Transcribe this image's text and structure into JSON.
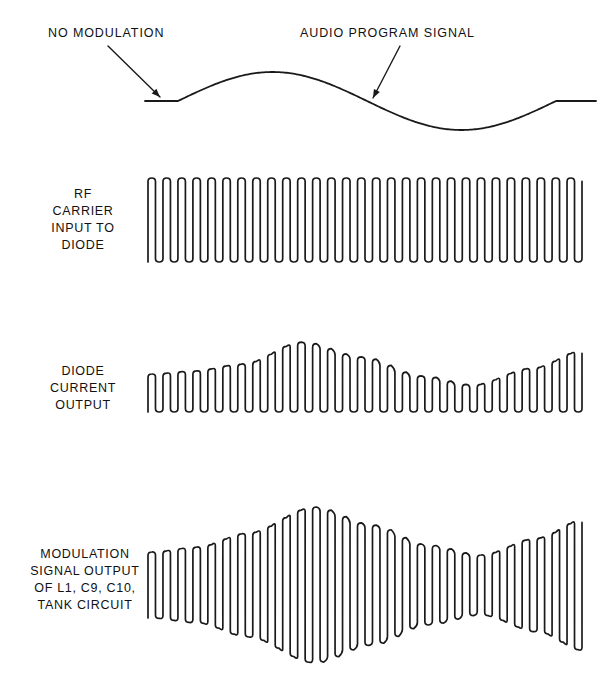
{
  "figure": {
    "background_color": "#ffffff",
    "line_color": "#1a1a1a"
  },
  "callouts": [
    {
      "id": "no-modulation",
      "text": "NO MODULATION",
      "leader": {
        "x1": 108,
        "y1": 46,
        "x2": 160,
        "y2": 97
      }
    },
    {
      "id": "audio-program-signal",
      "text": "AUDIO PROGRAM SIGNAL",
      "leader": {
        "x1": 400,
        "y1": 46,
        "x2": 373,
        "y2": 98
      }
    }
  ],
  "trace_labels": [
    {
      "id": "rf-carrier-input-to-diode",
      "lines": [
        "RF",
        "CARRIER",
        "INPUT TO",
        "DIODE"
      ]
    },
    {
      "id": "diode-current-output",
      "lines": [
        "DIODE",
        "CURRENT",
        "OUTPUT"
      ]
    },
    {
      "id": "modulation-signal-output",
      "lines": [
        "MODULATION",
        "SIGNAL OUTPUT",
        "OF L1, C9, C10,",
        "TANK CIRCUIT"
      ]
    }
  ],
  "chart_data": [
    {
      "id": "audio-program-waveform",
      "type": "line",
      "title": "Audio program signal (modulating envelope)",
      "description": "Flat no-modulation segment followed by one cycle of an audio sine wave, ending in a flat segment.",
      "xlabel": "",
      "ylabel": "",
      "x_range": [
        145,
        596
      ],
      "y_baseline": 101,
      "flat_lead_in": {
        "x_start": 145,
        "x_end": 178,
        "y": 101
      },
      "flat_lead_out": {
        "x_start": 556,
        "x_end": 596,
        "y": 101
      },
      "sine": {
        "x_start": 178,
        "x_end": 556,
        "cycles": 1,
        "amplitude": 29,
        "peak_x": 272,
        "peak_y": 72,
        "zero_cross_x": 367,
        "trough_x": 462,
        "trough_y": 130
      }
    },
    {
      "id": "rf-carrier-input-waveform",
      "type": "line",
      "title": "RF carrier input to diode",
      "description": "Unmodulated RF carrier drawn as a dense constant-amplitude oscilloscope trace with rounded peaks.",
      "xlabel": "",
      "ylabel": "",
      "x_range": [
        148,
        582
      ],
      "cycles": 29,
      "center_y": 220,
      "amplitude_constant": 42,
      "top_y": 178,
      "bottom_y": 263,
      "envelope": "constant"
    },
    {
      "id": "diode-current-output-waveform",
      "type": "line",
      "title": "Diode current output",
      "description": "Half-wave rectified carrier: bottoms rest on a flat baseline while the tops follow the audio envelope.",
      "xlabel": "",
      "ylabel": "",
      "x_range": [
        148,
        582
      ],
      "cycles": 29,
      "baseline_y": 412,
      "envelope": "rectified-one-sided",
      "amplitude_min": 27,
      "amplitude_max": 70,
      "envelope_peak_x": 300,
      "envelope_trough_x": 470,
      "envelope_samples": [
        {
          "x": 148,
          "amplitude": 38
        },
        {
          "x": 190,
          "amplitude": 41
        },
        {
          "x": 240,
          "amplitude": 48
        },
        {
          "x": 300,
          "amplitude": 70
        },
        {
          "x": 360,
          "amplitude": 55
        },
        {
          "x": 420,
          "amplitude": 36
        },
        {
          "x": 470,
          "amplitude": 27
        },
        {
          "x": 530,
          "amplitude": 44
        },
        {
          "x": 582,
          "amplitude": 62
        }
      ]
    },
    {
      "id": "modulation-signal-output-waveform",
      "type": "line",
      "title": "Modulation signal output of L1, C9, C10 tank circuit",
      "description": "Amplitude-modulated carrier symmetric about a center axis; envelope swells to a maximum then narrows and grows again.",
      "xlabel": "",
      "ylabel": "",
      "x_range": [
        148,
        582
      ],
      "cycles": 29,
      "center_y": 585,
      "envelope": "symmetric",
      "amplitude_min": 30,
      "amplitude_max": 78,
      "envelope_peak_x": 312,
      "envelope_trough_x": 478,
      "envelope_samples": [
        {
          "x": 148,
          "amplitude": 33
        },
        {
          "x": 195,
          "amplitude": 38
        },
        {
          "x": 245,
          "amplitude": 52
        },
        {
          "x": 312,
          "amplitude": 78
        },
        {
          "x": 370,
          "amplitude": 60
        },
        {
          "x": 425,
          "amplitude": 40
        },
        {
          "x": 478,
          "amplitude": 30
        },
        {
          "x": 535,
          "amplitude": 47
        },
        {
          "x": 582,
          "amplitude": 66
        }
      ]
    }
  ]
}
